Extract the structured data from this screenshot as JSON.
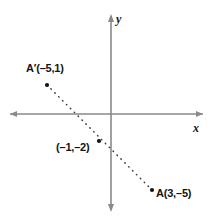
{
  "figure": {
    "kind": "coordinate-plane-diagram",
    "background_color": "#ffffff",
    "axis_color": "#8a8a8a",
    "line_color": "#3c3c3c",
    "point_color": "#141414",
    "text_color": "#141414"
  },
  "axes": {
    "x_label": "x",
    "y_label": "y",
    "origin_px": {
      "x": 111,
      "y": 114
    },
    "x_axis_px": {
      "x1": 8,
      "x2": 205,
      "y": 114
    },
    "y_axis_px": {
      "x": 111,
      "y1": 14,
      "y2": 212
    },
    "arrowheads": [
      "x-left",
      "x-right",
      "y-top",
      "y-bottom"
    ]
  },
  "points": [
    {
      "id": "a-prime",
      "label": "A′(–5,1)",
      "coords": {
        "x": -5,
        "y": 1
      },
      "px": {
        "x": 47,
        "y": 85
      }
    },
    {
      "id": "midpoint",
      "label": "(–1,–2)",
      "coords": {
        "x": -1,
        "y": -2
      },
      "px": {
        "x": 99,
        "y": 141
      }
    },
    {
      "id": "a",
      "label": "A(3,–5)",
      "coords": {
        "x": 3,
        "y": -5
      },
      "px": {
        "x": 152,
        "y": 190
      }
    }
  ],
  "segment": {
    "style": "dotted",
    "from": "a-prime",
    "to": "a",
    "passes_through": "midpoint"
  }
}
